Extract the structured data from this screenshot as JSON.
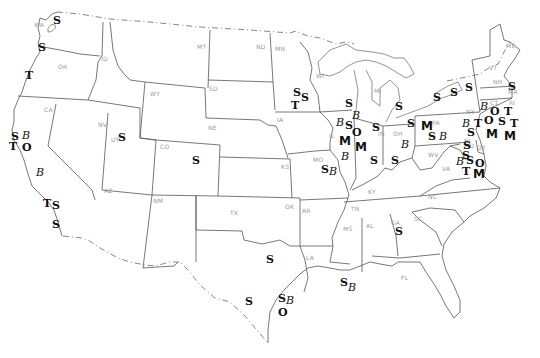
{
  "map": {
    "type": "us-states-outline",
    "state_labels": [
      {
        "code": "WA",
        "x": 34,
        "y": 21
      },
      {
        "code": "OR",
        "x": 58,
        "y": 63
      },
      {
        "code": "ID",
        "x": 101,
        "y": 55
      },
      {
        "code": "MT",
        "x": 197,
        "y": 43
      },
      {
        "code": "ND",
        "x": 256,
        "y": 43
      },
      {
        "code": "MN",
        "x": 275,
        "y": 45
      },
      {
        "code": "WY",
        "x": 150,
        "y": 90
      },
      {
        "code": "SD",
        "x": 209,
        "y": 85
      },
      {
        "code": "WI",
        "x": 316,
        "y": 72
      },
      {
        "code": "MI",
        "x": 374,
        "y": 87
      },
      {
        "code": "NY",
        "x": 466,
        "y": 108
      },
      {
        "code": "VT",
        "x": 489,
        "y": 64
      },
      {
        "code": "NH",
        "x": 493,
        "y": 78
      },
      {
        "code": "ME",
        "x": 506,
        "y": 42
      },
      {
        "code": "MA",
        "x": 508,
        "y": 88
      },
      {
        "code": "CT",
        "x": 490,
        "y": 99
      },
      {
        "code": "RI",
        "x": 509,
        "y": 99
      },
      {
        "code": "CA",
        "x": 44,
        "y": 106
      },
      {
        "code": "NV",
        "x": 98,
        "y": 121
      },
      {
        "code": "UT",
        "x": 111,
        "y": 136
      },
      {
        "code": "CO",
        "x": 160,
        "y": 143
      },
      {
        "code": "NE",
        "x": 208,
        "y": 124
      },
      {
        "code": "IA",
        "x": 277,
        "y": 116
      },
      {
        "code": "IL",
        "x": 329,
        "y": 132
      },
      {
        "code": "IN",
        "x": 378,
        "y": 130
      },
      {
        "code": "OH",
        "x": 393,
        "y": 130
      },
      {
        "code": "PA",
        "x": 432,
        "y": 119
      },
      {
        "code": "NJ",
        "x": 464,
        "y": 137
      },
      {
        "code": "MD",
        "x": 464,
        "y": 142
      },
      {
        "code": "DE",
        "x": 477,
        "y": 144
      },
      {
        "code": "WV",
        "x": 428,
        "y": 151
      },
      {
        "code": "VA",
        "x": 442,
        "y": 165
      },
      {
        "code": "KS",
        "x": 281,
        "y": 163
      },
      {
        "code": "MO",
        "x": 313,
        "y": 156
      },
      {
        "code": "KY",
        "x": 368,
        "y": 188
      },
      {
        "code": "AZ",
        "x": 104,
        "y": 187
      },
      {
        "code": "NM",
        "x": 153,
        "y": 197
      },
      {
        "code": "OK",
        "x": 285,
        "y": 203
      },
      {
        "code": "AR",
        "x": 302,
        "y": 207
      },
      {
        "code": "TN",
        "x": 351,
        "y": 205
      },
      {
        "code": "NC",
        "x": 428,
        "y": 193
      },
      {
        "code": "TX",
        "x": 230,
        "y": 209
      },
      {
        "code": "MS",
        "x": 343,
        "y": 225
      },
      {
        "code": "AL",
        "x": 366,
        "y": 222
      },
      {
        "code": "GA",
        "x": 391,
        "y": 219
      },
      {
        "code": "SC",
        "x": 414,
        "y": 215
      },
      {
        "code": "LA",
        "x": 306,
        "y": 254
      },
      {
        "code": "FL",
        "x": 401,
        "y": 274
      }
    ],
    "symbols": [
      {
        "glyph": "S",
        "x": 57,
        "y": 21
      },
      {
        "glyph": "S",
        "x": 42,
        "y": 48
      },
      {
        "glyph": "T",
        "x": 29,
        "y": 76
      },
      {
        "glyph": "S",
        "x": 15,
        "y": 137
      },
      {
        "glyph": "B",
        "x": 26,
        "y": 136
      },
      {
        "glyph": "T",
        "x": 13,
        "y": 147
      },
      {
        "glyph": "O",
        "x": 26,
        "y": 148
      },
      {
        "glyph": "S",
        "x": 122,
        "y": 138
      },
      {
        "glyph": "B",
        "x": 40,
        "y": 173
      },
      {
        "glyph": "T",
        "x": 47,
        "y": 204
      },
      {
        "glyph": "S",
        "x": 56,
        "y": 206
      },
      {
        "glyph": "S",
        "x": 56,
        "y": 225
      },
      {
        "glyph": "S",
        "x": 196,
        "y": 161
      },
      {
        "glyph": "S",
        "x": 297,
        "y": 93
      },
      {
        "glyph": "S",
        "x": 305,
        "y": 98
      },
      {
        "glyph": "T",
        "x": 295,
        "y": 106
      },
      {
        "glyph": "S",
        "x": 349,
        "y": 104
      },
      {
        "glyph": "B",
        "x": 340,
        "y": 123
      },
      {
        "glyph": "S",
        "x": 349,
        "y": 126
      },
      {
        "glyph": "B",
        "x": 356,
        "y": 116
      },
      {
        "glyph": "O",
        "x": 356,
        "y": 133
      },
      {
        "glyph": "M",
        "x": 343,
        "y": 141
      },
      {
        "glyph": "M",
        "x": 359,
        "y": 147
      },
      {
        "glyph": "B",
        "x": 345,
        "y": 157
      },
      {
        "glyph": "S",
        "x": 325,
        "y": 170
      },
      {
        "glyph": "B",
        "x": 333,
        "y": 172
      },
      {
        "glyph": "S",
        "x": 374,
        "y": 161
      },
      {
        "glyph": "S",
        "x": 395,
        "y": 161
      },
      {
        "glyph": "S",
        "x": 399,
        "y": 107
      },
      {
        "glyph": "S",
        "x": 411,
        "y": 124
      },
      {
        "glyph": "B",
        "x": 405,
        "y": 145
      },
      {
        "glyph": "S",
        "x": 376,
        "y": 128
      },
      {
        "glyph": "M",
        "x": 425,
        "y": 126
      },
      {
        "glyph": "S",
        "x": 437,
        "y": 98
      },
      {
        "glyph": "S",
        "x": 454,
        "y": 93
      },
      {
        "glyph": "S",
        "x": 469,
        "y": 88
      },
      {
        "glyph": "S",
        "x": 512,
        "y": 87
      },
      {
        "glyph": "B",
        "x": 484,
        "y": 107
      },
      {
        "glyph": "O",
        "x": 494,
        "y": 112
      },
      {
        "glyph": "T",
        "x": 508,
        "y": 112
      },
      {
        "glyph": "B",
        "x": 466,
        "y": 124
      },
      {
        "glyph": "T",
        "x": 478,
        "y": 124
      },
      {
        "glyph": "O",
        "x": 488,
        "y": 121
      },
      {
        "glyph": "S",
        "x": 502,
        "y": 122
      },
      {
        "glyph": "T",
        "x": 514,
        "y": 124
      },
      {
        "glyph": "S",
        "x": 471,
        "y": 133
      },
      {
        "glyph": "M",
        "x": 490,
        "y": 134
      },
      {
        "glyph": "M",
        "x": 508,
        "y": 136
      },
      {
        "glyph": "S",
        "x": 432,
        "y": 137
      },
      {
        "glyph": "B",
        "x": 443,
        "y": 137
      },
      {
        "glyph": "S",
        "x": 467,
        "y": 146
      },
      {
        "glyph": "S",
        "x": 466,
        "y": 156
      },
      {
        "glyph": "B",
        "x": 460,
        "y": 162
      },
      {
        "glyph": "S",
        "x": 470,
        "y": 161
      },
      {
        "glyph": "O",
        "x": 479,
        "y": 164
      },
      {
        "glyph": "T",
        "x": 466,
        "y": 172
      },
      {
        "glyph": "M",
        "x": 477,
        "y": 174
      },
      {
        "glyph": "S",
        "x": 399,
        "y": 232
      },
      {
        "glyph": "S",
        "x": 344,
        "y": 283
      },
      {
        "glyph": "B",
        "x": 352,
        "y": 288
      },
      {
        "glyph": "S",
        "x": 270,
        "y": 260
      },
      {
        "glyph": "S",
        "x": 249,
        "y": 302
      },
      {
        "glyph": "S",
        "x": 282,
        "y": 299
      },
      {
        "glyph": "B",
        "x": 290,
        "y": 301
      },
      {
        "glyph": "O",
        "x": 282,
        "y": 313
      }
    ]
  }
}
